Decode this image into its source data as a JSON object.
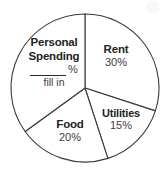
{
  "chart_data": {
    "type": "pie",
    "title": "",
    "subtitle": "",
    "xlabel": "",
    "ylabel": "",
    "legend_position": "inside-slices",
    "grid": false,
    "center": [
      85,
      88
    ],
    "radius": 74,
    "start_angle_deg": 0,
    "direction": "clockwise",
    "categories": [
      "Rent",
      "Utilities",
      "Food",
      "Personal Spending"
    ],
    "values": [
      30,
      15,
      20,
      35
    ],
    "unit": "%",
    "slices": [
      {
        "name": "Rent",
        "value": 30,
        "value_label": "30%",
        "start_deg": 0,
        "end_deg": 108,
        "fill": "#ffffff",
        "stroke": "#3a3a3a"
      },
      {
        "name": "Utilities",
        "value": 15,
        "value_label": "15%",
        "start_deg": 108,
        "end_deg": 162,
        "fill": "#ffffff",
        "stroke": "#3a3a3a"
      },
      {
        "name": "Food",
        "value": 20,
        "value_label": "20%",
        "start_deg": 162,
        "end_deg": 234,
        "fill": "#ffffff",
        "stroke": "#3a3a3a"
      },
      {
        "name": "Personal Spending",
        "value": 35,
        "value_label": "",
        "start_deg": 234,
        "end_deg": 360,
        "fill": "#ffffff",
        "stroke": "#3a3a3a",
        "is_blank": true,
        "blank_hint": "fill in",
        "blank_unit": "%"
      }
    ],
    "annotations": [
      {
        "name": "personal-spending-blank",
        "text": "fill in",
        "unit": "%"
      }
    ]
  },
  "labels": {
    "personal": {
      "line1": "Personal",
      "line2": "Spending",
      "percent_sign": "%",
      "fill_in": "fill in"
    },
    "rent": {
      "name": "Rent",
      "value": "30%"
    },
    "utilities": {
      "name": "Utilities",
      "value": "15%"
    },
    "food": {
      "name": "Food",
      "value": "20%"
    }
  },
  "colors": {
    "background": "#ffffff",
    "stroke": "#3a3a3a",
    "label_text": "#232323",
    "value_text": "#3d3d3d"
  }
}
